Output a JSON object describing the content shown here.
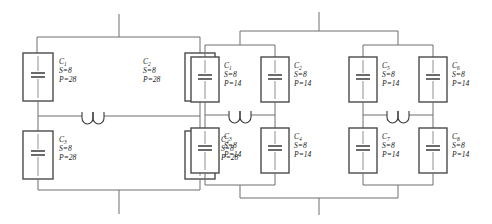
{
  "figure": {
    "background_color": "#ffffff",
    "wire_color": "#6f6f6f",
    "box_color": "#4a4a4a",
    "text_color": "#1c1c1c"
  },
  "circuits": [
    {
      "id": "left-circuit",
      "name": "left-capacitor-bank",
      "topology": "two-by-two-bridge",
      "has_inductor": true,
      "inductor_count": 1,
      "capacitors": [
        {
          "id": "L-C1",
          "label": "C",
          "subscript": "1",
          "s_label": "S",
          "s_value": "8",
          "p_label": "P",
          "p_value": "28",
          "position": "top-left"
        },
        {
          "id": "L-C2",
          "label": "C",
          "subscript": "2",
          "s_label": "S",
          "s_value": "8",
          "p_label": "P",
          "p_value": "28",
          "position": "top-right"
        },
        {
          "id": "L-C3",
          "label": "C",
          "subscript": "3",
          "s_label": "S",
          "s_value": "8",
          "p_label": "P",
          "p_value": "28",
          "position": "bottom-left"
        },
        {
          "id": "L-C4",
          "label": "C",
          "subscript": "4",
          "s_label": "S",
          "s_value": "8",
          "p_label": "P",
          "p_value": "28",
          "position": "bottom-right"
        }
      ]
    },
    {
      "id": "right-circuit",
      "name": "right-capacitor-bank",
      "topology": "four-by-two-tree",
      "has_inductor": true,
      "inductor_count": 2,
      "capacitors": [
        {
          "id": "R-C1",
          "label": "C",
          "subscript": "1",
          "s_label": "S",
          "s_value": "8",
          "p_label": "P",
          "p_value": "14",
          "position": "block1-top-left"
        },
        {
          "id": "R-C2",
          "label": "C",
          "subscript": "2",
          "s_label": "S",
          "s_value": "8",
          "p_label": "P",
          "p_value": "14",
          "position": "block1-top-right"
        },
        {
          "id": "R-C3",
          "label": "C",
          "subscript": "3",
          "s_label": "S",
          "s_value": "8",
          "p_label": "P",
          "p_value": "14",
          "position": "block1-bottom-left"
        },
        {
          "id": "R-C4",
          "label": "C",
          "subscript": "4",
          "s_label": "S",
          "s_value": "8",
          "p_label": "P",
          "p_value": "14",
          "position": "block1-bottom-right"
        },
        {
          "id": "R-C5",
          "label": "C",
          "subscript": "5",
          "s_label": "S",
          "s_value": "8",
          "p_label": "P",
          "p_value": "14",
          "position": "block2-top-left"
        },
        {
          "id": "R-C6",
          "label": "C",
          "subscript": "6",
          "s_label": "S",
          "s_value": "8",
          "p_label": "P",
          "p_value": "14",
          "position": "block2-top-right"
        },
        {
          "id": "R-C7",
          "label": "C",
          "subscript": "7",
          "s_label": "S",
          "s_value": "8",
          "p_label": "P",
          "p_value": "14",
          "position": "block2-bottom-left"
        },
        {
          "id": "R-C8",
          "label": "C",
          "subscript": "8",
          "s_label": "S",
          "s_value": "8",
          "p_label": "P",
          "p_value": "14",
          "position": "block2-bottom-right"
        }
      ]
    }
  ],
  "separators": {
    "equals": "="
  }
}
